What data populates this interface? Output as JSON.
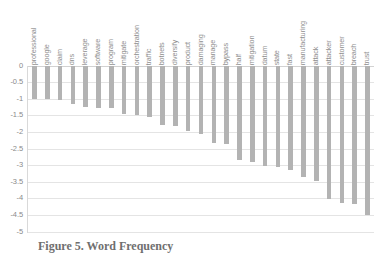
{
  "figure": {
    "caption": "Figure 5. Word Frequency",
    "bar_color": "#b3b3b3",
    "gridline_color": "#e4e4e4",
    "text_color": "#8a8a8a"
  },
  "chart_data": {
    "type": "bar",
    "title": "",
    "xlabel": "",
    "ylabel": "",
    "ylim": [
      -5,
      0
    ],
    "yticks": [
      0,
      -0.5,
      -1,
      -1.5,
      -2,
      -2.5,
      -3,
      -3.5,
      -4,
      -4.5,
      -5
    ],
    "ytick_labels": [
      "0",
      "-0.5",
      "-1",
      "-1.5",
      "-2",
      "-2.5",
      "-3",
      "-3.5",
      "-4",
      "-4.5",
      "-5"
    ],
    "grid": true,
    "legend": false,
    "orientation": "vertical",
    "categories": [
      "professional",
      "google",
      "claim",
      "dns",
      "leverage",
      "software",
      "program",
      "mitigate",
      "orchestration",
      "traffic",
      "botnets",
      "diversify",
      "product",
      "damaging",
      "manage",
      "bypass",
      "half",
      "mitigation",
      "datum",
      "state",
      "fast",
      "manufacturing",
      "attack",
      "attacker",
      "customer",
      "breach",
      "trust"
    ],
    "values": [
      -1.0,
      -1.0,
      -1.03,
      -1.13,
      -1.22,
      -1.25,
      -1.28,
      -1.45,
      -1.48,
      -1.55,
      -1.78,
      -1.82,
      -1.95,
      -2.05,
      -2.32,
      -2.35,
      -2.82,
      -2.9,
      -3.0,
      -3.03,
      -3.13,
      -3.33,
      -3.45,
      -4.02,
      -4.13,
      -4.15,
      -4.5
    ]
  }
}
